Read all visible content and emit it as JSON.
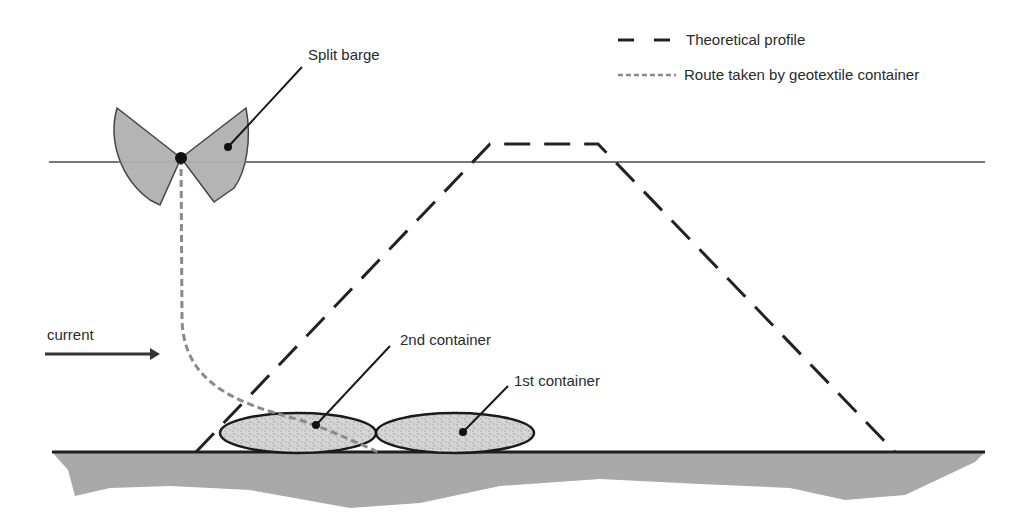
{
  "legend": {
    "items": [
      {
        "label": "Theoretical profile",
        "style": "long-dash",
        "color": "#222222"
      },
      {
        "label": "Route taken by geotextile container",
        "style": "short-dash",
        "color": "#888888"
      }
    ]
  },
  "labels": {
    "split_barge": "Split barge",
    "current": "current",
    "container_2": "2nd container",
    "container_1": "1st container"
  },
  "colors": {
    "barge_fill": "#b4b4b4",
    "ground_fill": "#a8a8a8",
    "container_fill": "#d4d4d4",
    "water_line": "#777777",
    "profile_line": "#222222",
    "route_line": "#8a8a8a"
  }
}
